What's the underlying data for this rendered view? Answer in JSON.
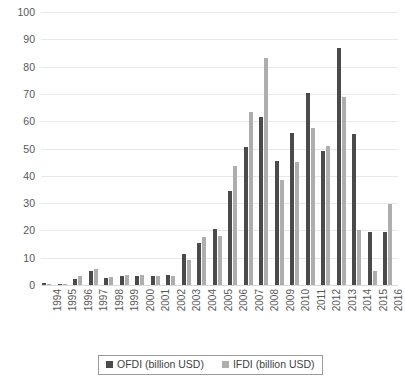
{
  "chart_data": {
    "type": "bar",
    "title": "",
    "subtitle": "",
    "xlabel": "",
    "ylabel": "",
    "ylim": [
      0,
      100
    ],
    "ytick_step": 10,
    "yticks": [
      "0",
      "10",
      "20",
      "30",
      "40",
      "50",
      "60",
      "70",
      "80",
      "90",
      "100"
    ],
    "grid": true,
    "legend_position": "bottom",
    "categories": [
      "1994",
      "1995",
      "1996",
      "1997",
      "1998",
      "1999",
      "2000",
      "2001",
      "2002",
      "2003",
      "2004",
      "2005",
      "2006",
      "2007",
      "2008",
      "2009",
      "2010",
      "2011",
      "2012",
      "2013",
      "2014",
      "2015",
      "2016"
    ],
    "series": [
      {
        "name": "OFDI (billion USD)",
        "color": "#4a4a4a",
        "values": [
          0.6,
          0.4,
          2.1,
          2.6,
          2.6,
          1.8,
          0.9,
          6.9,
          2.5,
          2.9,
          5.5,
          12.3,
          21.2,
          26.5,
          55.9,
          56.5,
          68.8,
          74.7,
          87.8,
          107.8,
          123.1,
          145.7,
          217.0
        ]
      },
      {
        "name": "IFDI (billion USD)",
        "color": "#aeaeae",
        "values": [
          33.8,
          37.5,
          41.7,
          45.3,
          45.5,
          40.3,
          40.7,
          46.9,
          52.7,
          53.5,
          60.6,
          72.4,
          72.7,
          83.5,
          108.3,
          95.0,
          114.7,
          124.0,
          121.1,
          123.9,
          128.5,
          135.6,
          133.7
        ]
      }
    ],
    "series_plotted": [
      {
        "name": "OFDI (billion USD)",
        "values": [
          0.6,
          0.4,
          2.1,
          5.0,
          2.6,
          3.2,
          3.2,
          3.2,
          3.5,
          11.5,
          15.5,
          20.5,
          34.5,
          50.5,
          61.5,
          45.5,
          55.8,
          70.3,
          49.2,
          87.0,
          55.5,
          19.6,
          19.5
        ]
      },
      {
        "name": "IFDI (billion USD)",
        "values": [
          0.2,
          0.3,
          3.3,
          6.0,
          3.0,
          3.5,
          3.7,
          3.3,
          3.4,
          9.3,
          17.5,
          18.0,
          43.5,
          63.5,
          83.2,
          38.5,
          45.2,
          57.5,
          50.8,
          68.8,
          20.0,
          5.0,
          29.5
        ]
      }
    ]
  },
  "legend": {
    "items": [
      {
        "label": "OFDI (billion USD)",
        "color": "#4a4a4a",
        "swatch": "square-dark-swatch"
      },
      {
        "label": "IFDI (billion USD)",
        "color": "#aeaeae",
        "swatch": "square-light-swatch"
      }
    ]
  },
  "colors": {
    "ofdi": "#4a4a4a",
    "ifdi": "#aeaeae",
    "gridline": "#e9e9e9",
    "tick_text": "#585858",
    "legend_border": "#9a9a9a",
    "background": "#ffffff"
  }
}
